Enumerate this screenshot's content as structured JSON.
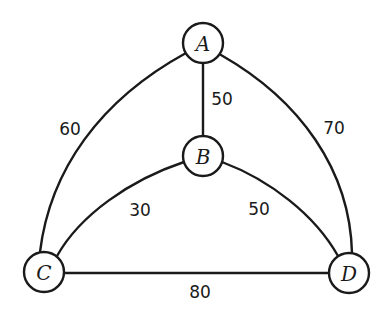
{
  "diagram": {
    "type": "weighted-undirected-graph",
    "nodes": [
      {
        "id": "A",
        "label": "A",
        "x": 203,
        "y": 43
      },
      {
        "id": "B",
        "label": "B",
        "x": 203,
        "y": 156
      },
      {
        "id": "C",
        "label": "C",
        "x": 44,
        "y": 272
      },
      {
        "id": "D",
        "label": "D",
        "x": 349,
        "y": 273
      }
    ],
    "edges": [
      {
        "from": "A",
        "to": "B",
        "weight": "50",
        "shape": "straight"
      },
      {
        "from": "A",
        "to": "C",
        "weight": "60",
        "shape": "curved"
      },
      {
        "from": "A",
        "to": "D",
        "weight": "70",
        "shape": "curved"
      },
      {
        "from": "B",
        "to": "C",
        "weight": "30",
        "shape": "curved"
      },
      {
        "from": "B",
        "to": "D",
        "weight": "50",
        "shape": "curved"
      },
      {
        "from": "C",
        "to": "D",
        "weight": "80",
        "shape": "straight"
      }
    ],
    "colors": {
      "stroke": "#1a1a1a",
      "background": "#ffffff"
    }
  }
}
